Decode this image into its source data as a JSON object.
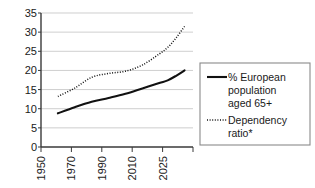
{
  "chart_data": {
    "type": "line",
    "title": "",
    "subtitle": "",
    "xlabel": "",
    "ylabel": "",
    "xlim": [
      1950,
      2040
    ],
    "ylim": [
      0,
      35
    ],
    "grid": true,
    "legend_position": "right",
    "y_ticks": [
      "0",
      "5",
      "10",
      "15",
      "20",
      "25",
      "30",
      "35"
    ],
    "y_tick_values": [
      0,
      5,
      10,
      15,
      20,
      25,
      30,
      35
    ],
    "x_ticks": [
      "1950",
      "1970",
      "1990",
      "2010",
      "2025",
      ""
    ],
    "x_tick_values": [
      1950,
      1970,
      1990,
      2010,
      2025,
      2040
    ],
    "series": [
      {
        "name": "% European population aged 65+",
        "style": "solid",
        "color": "#111111",
        "x": [
          1960,
          1970,
          1980,
          1990,
          2000,
          2010,
          2020,
          2025,
          2030,
          2035
        ],
        "values": [
          8.8,
          10.4,
          11.8,
          12.8,
          13.9,
          15.3,
          16.7,
          17.4,
          18.6,
          20.0
        ]
      },
      {
        "name": "Dependency ratio*",
        "style": "dotted",
        "color": "#111111",
        "x": [
          1960,
          1970,
          1980,
          1990,
          2000,
          2010,
          2020,
          2025,
          2030,
          2035
        ],
        "values": [
          13.2,
          15.4,
          18.2,
          19.2,
          19.8,
          21.4,
          24.3,
          26.0,
          28.5,
          31.5
        ]
      }
    ],
    "annotations": [
      "* footnote marker on Dependency ratio"
    ]
  },
  "legend": {
    "entries": [
      {
        "icon": "solid-line-swatch",
        "lines": [
          "% European",
          "population",
          "aged 65+"
        ]
      },
      {
        "icon": "dotted-line-swatch",
        "lines": [
          "Dependency",
          "ratio*"
        ]
      }
    ]
  }
}
